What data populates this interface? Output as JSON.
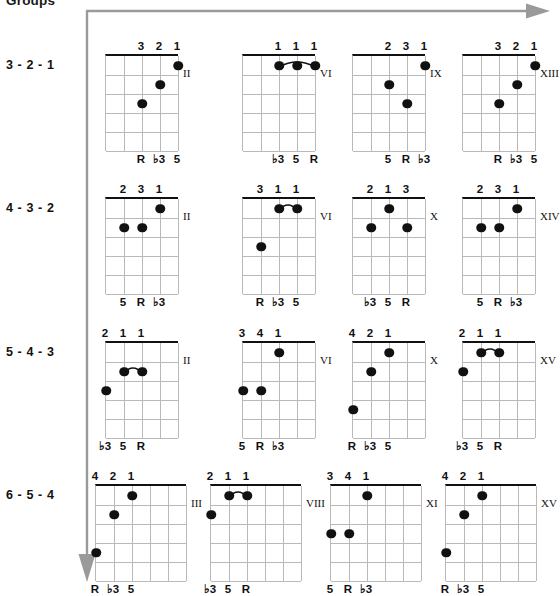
{
  "heading": "Groups",
  "colors": {
    "arrow": "#9a9a9a",
    "nut": "#111111",
    "grid": "#b9b9b9",
    "dot": "#111111",
    "text": "#111111"
  },
  "axis": {
    "horizontal_arrow_name": "right-arrow",
    "vertical_arrow_name": "down-arrow"
  },
  "rows": [
    {
      "label": "3 - 2 - 1",
      "strings": 5,
      "diagrams": [
        {
          "position": "II",
          "fingers": [
            {
              "string": 3,
              "text": "3"
            },
            {
              "string": 4,
              "text": "2"
            },
            {
              "string": 5,
              "text": "1"
            }
          ],
          "dots": [
            {
              "string": 3,
              "fret": 3
            },
            {
              "string": 4,
              "fret": 2
            },
            {
              "string": 5,
              "fret": 1
            }
          ],
          "intervals": [
            {
              "string": 3,
              "text": "R"
            },
            {
              "string": 4,
              "text": "♭3"
            },
            {
              "string": 5,
              "text": "5"
            }
          ],
          "barre": null
        },
        {
          "position": "VI",
          "fingers": [
            {
              "string": 3,
              "text": "1"
            },
            {
              "string": 4,
              "text": "1"
            },
            {
              "string": 5,
              "text": "1"
            }
          ],
          "dots": [
            {
              "string": 3,
              "fret": 1
            },
            {
              "string": 4,
              "fret": 1
            },
            {
              "string": 5,
              "fret": 1
            }
          ],
          "intervals": [
            {
              "string": 3,
              "text": "♭3"
            },
            {
              "string": 4,
              "text": "5"
            },
            {
              "string": 5,
              "text": "R"
            }
          ],
          "barre": {
            "from": 3,
            "to": 5,
            "fret": 1
          }
        },
        {
          "position": "IX",
          "fingers": [
            {
              "string": 3,
              "text": "2"
            },
            {
              "string": 4,
              "text": "3"
            },
            {
              "string": 5,
              "text": "1"
            }
          ],
          "dots": [
            {
              "string": 3,
              "fret": 2
            },
            {
              "string": 4,
              "fret": 3
            },
            {
              "string": 5,
              "fret": 1
            }
          ],
          "intervals": [
            {
              "string": 3,
              "text": "5"
            },
            {
              "string": 4,
              "text": "R"
            },
            {
              "string": 5,
              "text": "♭3"
            }
          ],
          "barre": null
        },
        {
          "position": "XIII",
          "fingers": [
            {
              "string": 3,
              "text": "3"
            },
            {
              "string": 4,
              "text": "2"
            },
            {
              "string": 5,
              "text": "1"
            }
          ],
          "dots": [
            {
              "string": 3,
              "fret": 3
            },
            {
              "string": 4,
              "fret": 2
            },
            {
              "string": 5,
              "fret": 1
            }
          ],
          "intervals": [
            {
              "string": 3,
              "text": "R"
            },
            {
              "string": 4,
              "text": "♭3"
            },
            {
              "string": 5,
              "text": "5"
            }
          ],
          "barre": null
        }
      ]
    },
    {
      "label": "4 - 3 - 2",
      "strings": 5,
      "diagrams": [
        {
          "position": "II",
          "fingers": [
            {
              "string": 2,
              "text": "2"
            },
            {
              "string": 3,
              "text": "3"
            },
            {
              "string": 4,
              "text": "1"
            }
          ],
          "dots": [
            {
              "string": 2,
              "fret": 2
            },
            {
              "string": 3,
              "fret": 2
            },
            {
              "string": 4,
              "fret": 1
            }
          ],
          "intervals": [
            {
              "string": 2,
              "text": "5"
            },
            {
              "string": 3,
              "text": "R"
            },
            {
              "string": 4,
              "text": "♭3"
            }
          ],
          "barre": null
        },
        {
          "position": "VI",
          "fingers": [
            {
              "string": 2,
              "text": "3"
            },
            {
              "string": 3,
              "text": "1"
            },
            {
              "string": 4,
              "text": "1"
            }
          ],
          "dots": [
            {
              "string": 2,
              "fret": 3
            },
            {
              "string": 3,
              "fret": 1
            },
            {
              "string": 4,
              "fret": 1
            }
          ],
          "intervals": [
            {
              "string": 2,
              "text": "R"
            },
            {
              "string": 3,
              "text": "♭3"
            },
            {
              "string": 4,
              "text": "5"
            }
          ],
          "barre": {
            "from": 3,
            "to": 4,
            "fret": 1
          }
        },
        {
          "position": "X",
          "fingers": [
            {
              "string": 2,
              "text": "2"
            },
            {
              "string": 3,
              "text": "1"
            },
            {
              "string": 4,
              "text": "3"
            }
          ],
          "dots": [
            {
              "string": 2,
              "fret": 2
            },
            {
              "string": 3,
              "fret": 1
            },
            {
              "string": 4,
              "fret": 2
            }
          ],
          "intervals": [
            {
              "string": 2,
              "text": "♭3"
            },
            {
              "string": 3,
              "text": "5"
            },
            {
              "string": 4,
              "text": "R"
            }
          ],
          "barre": null
        },
        {
          "position": "XIV",
          "fingers": [
            {
              "string": 2,
              "text": "2"
            },
            {
              "string": 3,
              "text": "3"
            },
            {
              "string": 4,
              "text": "1"
            }
          ],
          "dots": [
            {
              "string": 2,
              "fret": 2
            },
            {
              "string": 3,
              "fret": 2
            },
            {
              "string": 4,
              "fret": 1
            }
          ],
          "intervals": [
            {
              "string": 2,
              "text": "5"
            },
            {
              "string": 3,
              "text": "R"
            },
            {
              "string": 4,
              "text": "♭3"
            }
          ],
          "barre": null
        }
      ]
    },
    {
      "label": "5 - 4 - 3",
      "strings": 5,
      "diagrams": [
        {
          "position": "II",
          "fingers": [
            {
              "string": 1,
              "text": "2"
            },
            {
              "string": 2,
              "text": "1"
            },
            {
              "string": 3,
              "text": "1"
            }
          ],
          "dots": [
            {
              "string": 1,
              "fret": 3
            },
            {
              "string": 2,
              "fret": 2
            },
            {
              "string": 3,
              "fret": 2
            }
          ],
          "intervals": [
            {
              "string": 1,
              "text": "♭3"
            },
            {
              "string": 2,
              "text": "5"
            },
            {
              "string": 3,
              "text": "R"
            }
          ],
          "barre": {
            "from": 2,
            "to": 3,
            "fret": 2
          }
        },
        {
          "position": "VI",
          "fingers": [
            {
              "string": 1,
              "text": "3"
            },
            {
              "string": 2,
              "text": "4"
            },
            {
              "string": 3,
              "text": "1"
            }
          ],
          "dots": [
            {
              "string": 1,
              "fret": 3
            },
            {
              "string": 2,
              "fret": 3
            },
            {
              "string": 3,
              "fret": 1
            }
          ],
          "intervals": [
            {
              "string": 1,
              "text": "5"
            },
            {
              "string": 2,
              "text": "R"
            },
            {
              "string": 3,
              "text": "♭3"
            }
          ],
          "barre": null
        },
        {
          "position": "X",
          "fingers": [
            {
              "string": 1,
              "text": "4"
            },
            {
              "string": 2,
              "text": "2"
            },
            {
              "string": 3,
              "text": "1"
            }
          ],
          "dots": [
            {
              "string": 1,
              "fret": 4
            },
            {
              "string": 2,
              "fret": 2
            },
            {
              "string": 3,
              "fret": 1
            }
          ],
          "intervals": [
            {
              "string": 1,
              "text": "R"
            },
            {
              "string": 2,
              "text": "♭3"
            },
            {
              "string": 3,
              "text": "5"
            }
          ],
          "barre": null
        },
        {
          "position": "XV",
          "fingers": [
            {
              "string": 1,
              "text": "2"
            },
            {
              "string": 2,
              "text": "1"
            },
            {
              "string": 3,
              "text": "1"
            }
          ],
          "dots": [
            {
              "string": 1,
              "fret": 2
            },
            {
              "string": 2,
              "fret": 1
            },
            {
              "string": 3,
              "fret": 1
            }
          ],
          "intervals": [
            {
              "string": 1,
              "text": "♭3"
            },
            {
              "string": 2,
              "text": "5"
            },
            {
              "string": 3,
              "text": "R"
            }
          ],
          "barre": {
            "from": 2,
            "to": 3,
            "fret": 1
          }
        }
      ]
    },
    {
      "label": "6 - 5 - 4",
      "strings": 6,
      "diagrams": [
        {
          "position": "III",
          "fingers": [
            {
              "string": 1,
              "text": "4"
            },
            {
              "string": 2,
              "text": "2"
            },
            {
              "string": 3,
              "text": "1"
            }
          ],
          "dots": [
            {
              "string": 1,
              "fret": 4
            },
            {
              "string": 2,
              "fret": 2
            },
            {
              "string": 3,
              "fret": 1
            }
          ],
          "intervals": [
            {
              "string": 1,
              "text": "R"
            },
            {
              "string": 2,
              "text": "♭3"
            },
            {
              "string": 3,
              "text": "5"
            }
          ],
          "barre": null
        },
        {
          "position": "VIII",
          "fingers": [
            {
              "string": 1,
              "text": "2"
            },
            {
              "string": 2,
              "text": "1"
            },
            {
              "string": 3,
              "text": "1"
            }
          ],
          "dots": [
            {
              "string": 1,
              "fret": 2
            },
            {
              "string": 2,
              "fret": 1
            },
            {
              "string": 3,
              "fret": 1
            }
          ],
          "intervals": [
            {
              "string": 1,
              "text": "♭3"
            },
            {
              "string": 2,
              "text": "5"
            },
            {
              "string": 3,
              "text": "R"
            }
          ],
          "barre": {
            "from": 2,
            "to": 3,
            "fret": 1
          }
        },
        {
          "position": "XI",
          "fingers": [
            {
              "string": 1,
              "text": "3"
            },
            {
              "string": 2,
              "text": "4"
            },
            {
              "string": 3,
              "text": "1"
            }
          ],
          "dots": [
            {
              "string": 1,
              "fret": 3
            },
            {
              "string": 2,
              "fret": 3
            },
            {
              "string": 3,
              "fret": 1
            }
          ],
          "intervals": [
            {
              "string": 1,
              "text": "5"
            },
            {
              "string": 2,
              "text": "R"
            },
            {
              "string": 3,
              "text": "♭3"
            }
          ],
          "barre": null
        },
        {
          "position": "XV",
          "fingers": [
            {
              "string": 1,
              "text": "4"
            },
            {
              "string": 2,
              "text": "2"
            },
            {
              "string": 3,
              "text": "1"
            }
          ],
          "dots": [
            {
              "string": 1,
              "fret": 4
            },
            {
              "string": 2,
              "fret": 2
            },
            {
              "string": 3,
              "fret": 1
            }
          ],
          "intervals": [
            {
              "string": 1,
              "text": "R"
            },
            {
              "string": 2,
              "text": "♭3"
            },
            {
              "string": 3,
              "text": "5"
            }
          ],
          "barre": null
        }
      ]
    }
  ]
}
